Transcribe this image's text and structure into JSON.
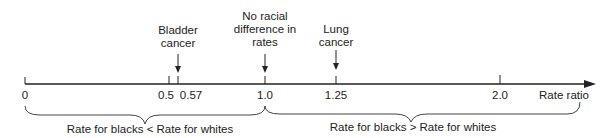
{
  "diagram": {
    "type": "number-line",
    "axis_label": "Rate ratio",
    "ticks": [
      {
        "value": "0",
        "x": 25
      },
      {
        "value": "0.5",
        "x": 169
      },
      {
        "value": "0.57",
        "x": 178
      },
      {
        "value": "1.0",
        "x": 265
      },
      {
        "value": "1.25",
        "x": 336
      },
      {
        "value": "2.0",
        "x": 500
      }
    ],
    "annotations": [
      {
        "line1": "Bladder",
        "line2": "cancer",
        "line3": "",
        "x": 178
      },
      {
        "line1": "No racial",
        "line2": "difference in",
        "line3": "rates",
        "x": 265
      },
      {
        "line1": "Lung",
        "line2": "cancer",
        "line3": "",
        "x": 336
      }
    ],
    "braces": [
      {
        "label": "Rate for blacks < Rate for whites",
        "from": 0,
        "to": 1.0
      },
      {
        "label": "Rate for blacks > Rate for whites",
        "from": 1.0,
        "to": "end"
      }
    ]
  }
}
